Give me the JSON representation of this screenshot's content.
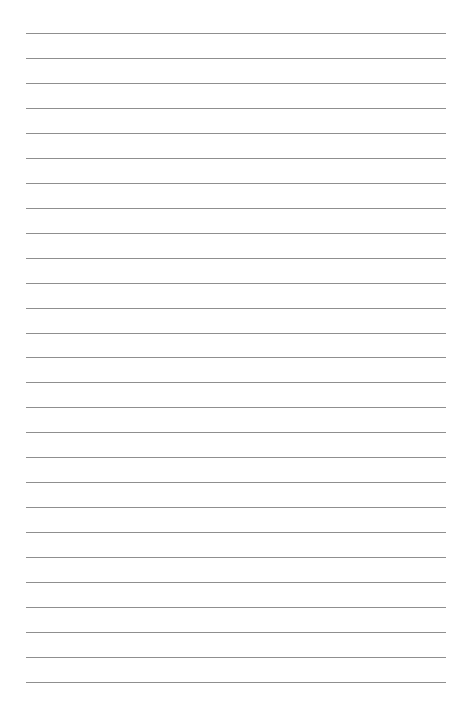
{
  "page": {
    "type": "lined-paper",
    "line_count": 27,
    "first_line_y": 33,
    "line_spacing": 24.96,
    "line_left": 26,
    "line_width": 420,
    "line_color": "#8f8f8f",
    "background": "#ffffff"
  }
}
